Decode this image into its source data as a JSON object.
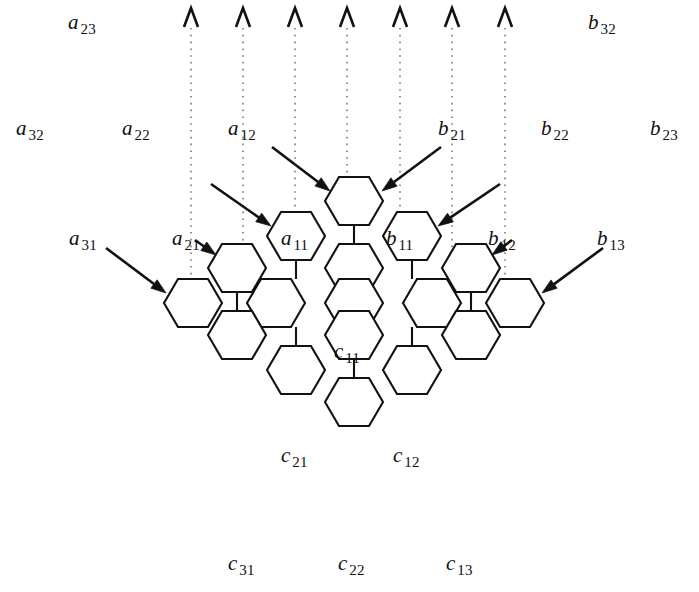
{
  "figure": {
    "width": 699,
    "height": 592,
    "background": "#ffffff",
    "ink_color": "#111111",
    "guide_color": "#5a5a5a"
  },
  "cell_labels": [
    {
      "name": "cell-label-a11",
      "symbol": "a",
      "subscript": "11",
      "x": 281,
      "y": 228
    },
    {
      "name": "cell-label-b11",
      "symbol": "b",
      "subscript": "11",
      "x": 386,
      "y": 228
    },
    {
      "name": "cell-label-c11",
      "symbol": "c",
      "subscript": "11",
      "x": 334,
      "y": 341
    }
  ],
  "input_labels": [
    {
      "name": "label-a23",
      "symbol": "a",
      "subscript": "23",
      "x": 68,
      "y": 12
    },
    {
      "name": "label-b32",
      "symbol": "b",
      "subscript": "32",
      "x": 588,
      "y": 12
    },
    {
      "name": "label-a32",
      "symbol": "a",
      "subscript": "32",
      "x": 16,
      "y": 118
    },
    {
      "name": "label-a22",
      "symbol": "a",
      "subscript": "22",
      "x": 122,
      "y": 118
    },
    {
      "name": "label-a12",
      "symbol": "a",
      "subscript": "12",
      "x": 228,
      "y": 118
    },
    {
      "name": "label-b21",
      "symbol": "b",
      "subscript": "21",
      "x": 438,
      "y": 118
    },
    {
      "name": "label-b22",
      "symbol": "b",
      "subscript": "22",
      "x": 541,
      "y": 118
    },
    {
      "name": "label-b23",
      "symbol": "b",
      "subscript": "23",
      "x": 650,
      "y": 118
    },
    {
      "name": "label-a31",
      "symbol": "a",
      "subscript": "31",
      "x": 69,
      "y": 228
    },
    {
      "name": "label-a21",
      "symbol": "a",
      "subscript": "21",
      "x": 172,
      "y": 228
    },
    {
      "name": "label-b12",
      "symbol": "b",
      "subscript": "12",
      "x": 488,
      "y": 228
    },
    {
      "name": "label-b13",
      "symbol": "b",
      "subscript": "13",
      "x": 597,
      "y": 228
    }
  ],
  "output_labels": [
    {
      "name": "label-c21",
      "symbol": "c",
      "subscript": "21",
      "x": 281,
      "y": 445
    },
    {
      "name": "label-c12",
      "symbol": "c",
      "subscript": "12",
      "x": 393,
      "y": 445
    },
    {
      "name": "label-c31",
      "symbol": "c",
      "subscript": "31",
      "x": 228,
      "y": 553
    },
    {
      "name": "label-c22",
      "symbol": "c",
      "subscript": "22",
      "x": 338,
      "y": 553
    },
    {
      "name": "label-c13",
      "symbol": "c",
      "subscript": "13",
      "x": 446,
      "y": 553
    }
  ],
  "geometry": {
    "hex_half_width": 29,
    "hex_half_height": 24,
    "hex_flat_half": 15,
    "column_pitch": 78,
    "row_pitch": 67,
    "cells": [
      {
        "name": "hex-top",
        "cx": 354,
        "cy": 201
      },
      {
        "name": "hex-a11",
        "cx": 296,
        "cy": 236
      },
      {
        "name": "hex-b11",
        "cx": 412,
        "cy": 236
      },
      {
        "name": "hex-row2-1",
        "cx": 237,
        "cy": 268
      },
      {
        "name": "hex-row2-2",
        "cx": 354,
        "cy": 268
      },
      {
        "name": "hex-row2-3",
        "cx": 471,
        "cy": 268
      },
      {
        "name": "hex-row3-1",
        "cx": 193,
        "cy": 303
      },
      {
        "name": "hex-row3-2",
        "cx": 276,
        "cy": 303
      },
      {
        "name": "hex-row3-3",
        "cx": 354,
        "cy": 303
      },
      {
        "name": "hex-row3-4",
        "cx": 432,
        "cy": 303
      },
      {
        "name": "hex-row3-5",
        "cx": 515,
        "cy": 303
      },
      {
        "name": "hex-row4-1",
        "cx": 237,
        "cy": 335
      },
      {
        "name": "hex-c11",
        "cx": 354,
        "cy": 335
      },
      {
        "name": "hex-row4-3",
        "cx": 471,
        "cy": 335
      },
      {
        "name": "hex-row5-1",
        "cx": 296,
        "cy": 370
      },
      {
        "name": "hex-row5-2",
        "cx": 412,
        "cy": 370
      },
      {
        "name": "hex-bottom",
        "cx": 354,
        "cy": 402
      }
    ],
    "links": [
      {
        "name": "link-vertical-top",
        "x1": 354,
        "y1": 225,
        "x2": 354,
        "y2": 244
      },
      {
        "name": "link-vertical-mid",
        "x1": 354,
        "y1": 292,
        "x2": 354,
        "y2": 311
      },
      {
        "name": "link-vertical-c11",
        "x1": 354,
        "y1": 359,
        "x2": 354,
        "y2": 378
      },
      {
        "name": "link-vertical-a11",
        "x1": 296,
        "y1": 260,
        "x2": 296,
        "y2": 279
      },
      {
        "name": "link-vertical-b11",
        "x1": 412,
        "y1": 260,
        "x2": 412,
        "y2": 279
      },
      {
        "name": "link-vertical-left2",
        "x1": 237,
        "y1": 292,
        "x2": 237,
        "y2": 311
      },
      {
        "name": "link-vertical-right2",
        "x1": 471,
        "y1": 292,
        "x2": 471,
        "y2": 311
      },
      {
        "name": "link-vertical-left3",
        "x1": 296,
        "y1": 327,
        "x2": 296,
        "y2": 346
      },
      {
        "name": "link-vertical-right3",
        "x1": 412,
        "y1": 327,
        "x2": 412,
        "y2": 346
      }
    ]
  },
  "top_ticks": {
    "name": "top-arrow-ticks",
    "y_tip": 8,
    "y_base": 27,
    "half_span": 7,
    "x_positions": [
      191,
      243,
      295,
      347,
      400,
      452,
      505
    ]
  },
  "dotted_guides": {
    "name": "dotted-guide-lines",
    "y_start": 28,
    "x_positions": [
      191,
      243,
      295,
      347,
      400,
      452,
      505
    ],
    "y_ends": [
      287,
      254,
      221,
      188,
      221,
      254,
      287
    ]
  },
  "feed_arrows": [
    {
      "name": "arrow-a12",
      "x1": 272,
      "y1": 147,
      "x2": 330,
      "y2": 191
    },
    {
      "name": "arrow-b21",
      "x1": 441,
      "y1": 147,
      "x2": 382,
      "y2": 191
    },
    {
      "name": "arrow-a11",
      "x1": 211,
      "y1": 184,
      "x2": 271,
      "y2": 226
    },
    {
      "name": "arrow-b11",
      "x1": 500,
      "y1": 184,
      "x2": 438,
      "y2": 226
    },
    {
      "name": "arrow-a21",
      "x1": 195,
      "y1": 240,
      "x2": 216,
      "y2": 255
    },
    {
      "name": "arrow-b12",
      "x1": 512,
      "y1": 240,
      "x2": 492,
      "y2": 255
    },
    {
      "name": "arrow-a31",
      "x1": 106,
      "y1": 248,
      "x2": 166,
      "y2": 293
    },
    {
      "name": "arrow-b13",
      "x1": 603,
      "y1": 248,
      "x2": 542,
      "y2": 293
    }
  ]
}
